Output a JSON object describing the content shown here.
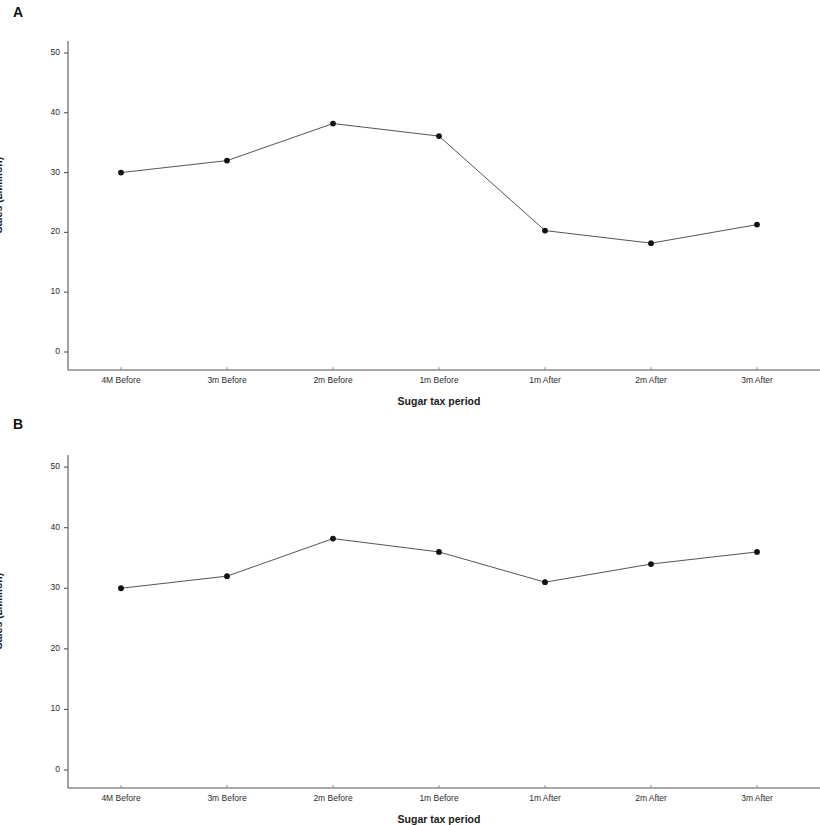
{
  "figure": {
    "background": "#ffffff",
    "panels": [
      {
        "id": "A",
        "label": "A",
        "chart_ref": 0
      },
      {
        "id": "B",
        "label": "B",
        "chart_ref": 1
      }
    ]
  },
  "chart_data": [
    {
      "type": "line",
      "panel": "A",
      "title": "",
      "xlabel": "Sugar tax period",
      "ylabel": "Sales (£Million)",
      "categories": [
        "4M Before",
        "3m Before",
        "2m Before",
        "1m Before",
        "1m After",
        "2m After",
        "3m After"
      ],
      "values": [
        30.0,
        32.0,
        38.2,
        36.1,
        20.3,
        18.2,
        21.3
      ],
      "ylim": [
        0,
        52
      ],
      "yticks": [
        0,
        10,
        20,
        30,
        40,
        50
      ],
      "ytick_labels": [
        "0",
        "10",
        "20",
        "30",
        "40",
        "50"
      ],
      "grid": false,
      "legend": "none",
      "marker": "filled-circle",
      "marker_color": "#111111",
      "line_color": "#555555",
      "line_width": 1
    },
    {
      "type": "line",
      "panel": "B",
      "title": "",
      "xlabel": "Sugar tax period",
      "ylabel": "Sales (£Million)",
      "categories": [
        "4M Before",
        "3m Before",
        "2m Before",
        "1m Before",
        "1m After",
        "2m After",
        "3m After"
      ],
      "values": [
        30.0,
        32.0,
        38.2,
        36.0,
        31.0,
        34.0,
        36.0
      ],
      "ylim": [
        0,
        52
      ],
      "yticks": [
        0,
        10,
        20,
        30,
        40,
        50
      ],
      "ytick_labels": [
        "0",
        "10",
        "20",
        "30",
        "40",
        "50"
      ],
      "grid": false,
      "legend": "none",
      "marker": "filled-circle",
      "marker_color": "#111111",
      "line_color": "#555555",
      "line_width": 1
    }
  ]
}
